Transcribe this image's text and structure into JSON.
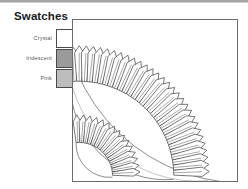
{
  "window": {
    "top_strip_color": "#a6a6a6"
  },
  "legend": {
    "title": "Swatches",
    "items": [
      {
        "label": "Crystal",
        "color": "#ffffff",
        "border": "#4a4a4a"
      },
      {
        "label": "Iridescent",
        "color": "#9a9a9a",
        "border": "#4a4a4a"
      },
      {
        "label": "Pink",
        "color": "#bdbdbd",
        "border": "#4a4a4a"
      }
    ]
  },
  "illustration": {
    "name": "radial-petal-fan-diagram",
    "border_color": "#6b6b6b",
    "background": "#ffffff",
    "stroke_color": "#3a3a3a",
    "center": {
      "x": 6,
      "y": 158
    },
    "rings": [
      {
        "name": "inner-ring",
        "inner_radius": 34,
        "outer_radius": 62,
        "count": 15,
        "start_angle": -92,
        "end_angle": -4,
        "half_width_deg": 2.7,
        "tip_ratio": 0.76
      },
      {
        "name": "outer-ring",
        "inner_radius": 96,
        "outer_radius": 132,
        "count": 30,
        "start_angle": -93,
        "end_angle": -2,
        "half_width_deg": 1.45,
        "tip_ratio": 0.8
      }
    ],
    "arcs": [
      {
        "name": "inner-ring-base-arc",
        "radius": 34,
        "stroke": "#5a5a5a"
      },
      {
        "name": "outer-ring-base-arc",
        "radius": 96,
        "stroke": "#5a5a5a"
      },
      {
        "name": "outer-ring-tip-arc",
        "radius": 131,
        "stroke": "#9a9a9a"
      },
      {
        "name": "outermost-arc",
        "radius": 183,
        "stroke": "#5a5a5a"
      }
    ]
  }
}
